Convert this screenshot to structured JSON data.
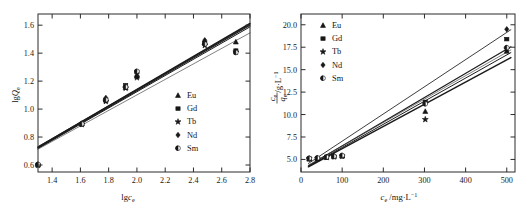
{
  "figure": {
    "panels": [
      "left",
      "right"
    ],
    "background_color": "#ffffff",
    "line_color": "#1b1b1b",
    "marker_color": "#171717"
  },
  "legend": {
    "entries": [
      {
        "label": "Eu",
        "marker": "triangle-up-filled"
      },
      {
        "label": "Gd",
        "marker": "square-filled"
      },
      {
        "label": "Tb",
        "marker": "star-filled"
      },
      {
        "label": "Nd",
        "marker": "diamond-filled"
      },
      {
        "label": "Sm",
        "marker": "circle-half"
      }
    ]
  },
  "chart_data": [
    {
      "type": "scatter",
      "panel": "left",
      "title": "",
      "xlabel": "lgc_e",
      "ylabel": "lgQ_e",
      "xlabel_parts": {
        "base": "lg",
        "italic": "c",
        "sub": "e"
      },
      "ylabel_parts": {
        "base": "lg",
        "italic": "Q",
        "sub": "e"
      },
      "xlim": [
        1.3,
        2.8
      ],
      "ylim": [
        0.55,
        1.68
      ],
      "xticks": [
        1.4,
        1.6,
        1.8,
        2.0,
        2.2,
        2.4,
        2.6,
        2.8
      ],
      "xtick_labels": [
        "1.4",
        "1.6",
        "1.8",
        "2.0",
        "2.2",
        "2.4",
        "2.6",
        "2.8"
      ],
      "yticks": [
        0.6,
        0.8,
        1.0,
        1.2,
        1.4,
        1.6
      ],
      "ytick_labels": [
        "0.6",
        "0.8",
        "1.0",
        "1.2",
        "1.4",
        "1.6"
      ],
      "grid": false,
      "legend_position": "right-middle",
      "series": [
        {
          "name": "Eu",
          "marker": "triangle-up-filled",
          "x": [
            1.3,
            1.61,
            1.78,
            1.92,
            2.0,
            2.48,
            2.7
          ],
          "y": [
            0.605,
            0.895,
            1.07,
            1.155,
            1.235,
            1.48,
            1.48
          ]
        },
        {
          "name": "Gd",
          "marker": "square-filled",
          "x": [
            1.3,
            1.61,
            1.78,
            1.92,
            2.0,
            2.48,
            2.7
          ],
          "y": [
            0.6,
            0.893,
            1.062,
            1.17,
            1.265,
            1.472,
            1.418
          ]
        },
        {
          "name": "Tb",
          "marker": "star-filled",
          "x": [
            1.3,
            1.61,
            1.78,
            1.92,
            2.0,
            2.48,
            2.7
          ],
          "y": [
            0.598,
            0.89,
            1.055,
            1.15,
            1.225,
            1.455,
            1.408
          ]
        },
        {
          "name": "Nd",
          "marker": "diamond-filled",
          "x": [
            1.3,
            1.61,
            1.78,
            1.92,
            2.0,
            2.48,
            2.7
          ],
          "y": [
            0.602,
            0.897,
            1.08,
            1.162,
            1.24,
            1.492,
            1.412
          ]
        },
        {
          "name": "Sm",
          "marker": "circle-half",
          "x": [
            1.3,
            1.61,
            1.78,
            1.92,
            2.0,
            2.48,
            2.7
          ],
          "y": [
            0.604,
            0.894,
            1.066,
            1.158,
            1.27,
            1.465,
            1.405
          ]
        }
      ],
      "fit_lines": [
        {
          "name": "Eu",
          "x0": 1.3,
          "y0": 0.727,
          "x1": 2.8,
          "y1": 1.612
        },
        {
          "name": "Gd",
          "x0": 1.3,
          "y0": 0.722,
          "x1": 2.8,
          "y1": 1.6
        },
        {
          "name": "Tb",
          "x0": 1.3,
          "y0": 0.718,
          "x1": 2.8,
          "y1": 1.588
        },
        {
          "name": "Nd",
          "x0": 1.3,
          "y0": 0.731,
          "x1": 2.8,
          "y1": 1.606
        },
        {
          "name": "Sm",
          "x0": 1.3,
          "y0": 0.713,
          "x1": 2.8,
          "y1": 1.545
        }
      ]
    },
    {
      "type": "scatter",
      "panel": "right",
      "title": "",
      "xlabel": "c_e /mg·L^-1",
      "ylabel": "c_e/q_e /g·L^-1",
      "xlabel_parts": {
        "italic": "c",
        "sub": "e",
        "unit": "/mg·L",
        "sup": "-1"
      },
      "ylabel_parts": {
        "num_italic": "c",
        "num_sub": "e",
        "den_italic": "q",
        "den_sub": "e",
        "unit": "/g·L",
        "sup": "-1"
      },
      "xlim": [
        0,
        520
      ],
      "ylim": [
        3.6,
        21.2
      ],
      "xticks": [
        0,
        100,
        200,
        300,
        400,
        500
      ],
      "xtick_labels": [
        "0",
        "100",
        "200",
        "300",
        "400",
        "500"
      ],
      "yticks": [
        5.0,
        7.5,
        10.0,
        12.5,
        15.0,
        17.5,
        20.0
      ],
      "ytick_labels": [
        "5.0",
        "7.5",
        "10.0",
        "12.5",
        "15.0",
        "17.5",
        "20.0"
      ],
      "grid": false,
      "legend_position": "top-left",
      "series": [
        {
          "name": "Eu",
          "marker": "triangle-up-filled",
          "x": [
            20,
            40,
            62,
            80,
            100,
            302,
            500
          ],
          "y": [
            5.05,
            5.1,
            5.25,
            5.35,
            5.4,
            10.35,
            17.05
          ]
        },
        {
          "name": "Gd",
          "marker": "square-filled",
          "x": [
            20,
            40,
            62,
            80,
            100,
            302,
            500
          ],
          "y": [
            5.1,
            5.15,
            5.28,
            5.32,
            5.38,
            11.4,
            18.4
          ]
        },
        {
          "name": "Tb",
          "marker": "star-filled",
          "x": [
            20,
            40,
            62,
            80,
            100,
            302,
            500
          ],
          "y": [
            5.08,
            5.12,
            5.22,
            5.3,
            5.36,
            9.45,
            17.3
          ]
        },
        {
          "name": "Nd",
          "marker": "diamond-filled",
          "x": [
            20,
            40,
            62,
            80,
            100,
            302,
            500
          ],
          "y": [
            5.06,
            5.14,
            5.24,
            5.33,
            5.42,
            11.3,
            19.5
          ]
        },
        {
          "name": "Sm",
          "marker": "circle-half",
          "x": [
            20,
            40,
            62,
            80,
            100,
            302,
            500
          ],
          "y": [
            5.12,
            5.16,
            5.26,
            5.34,
            5.44,
            11.2,
            17.45
          ]
        }
      ],
      "fit_lines": [
        {
          "name": "Eu",
          "x0": 18,
          "y0": 4.18,
          "x1": 510,
          "y1": 16.35
        },
        {
          "name": "Gd",
          "x0": 18,
          "y0": 4.3,
          "x1": 510,
          "y1": 17.55
        },
        {
          "name": "Tb",
          "x0": 18,
          "y0": 4.22,
          "x1": 510,
          "y1": 16.9
        },
        {
          "name": "Nd",
          "x0": 18,
          "y0": 4.55,
          "x1": 510,
          "y1": 19.45
        },
        {
          "name": "Sm",
          "x0": 18,
          "y0": 4.36,
          "x1": 510,
          "y1": 17.2
        }
      ]
    }
  ]
}
